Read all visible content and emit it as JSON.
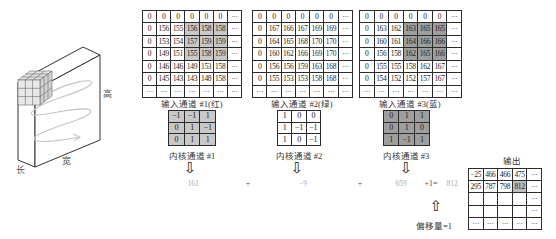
{
  "figure": {
    "axis_labels": {
      "height": "高",
      "width": "宽",
      "length": "长"
    }
  },
  "inputs": [
    {
      "label": "输入通道 #1(红)",
      "highlight_color": "#c8c8c8",
      "rows": [
        [
          "0",
          "0",
          "0",
          "0",
          "0",
          "0",
          "···"
        ],
        [
          "0",
          "156",
          "155",
          "156",
          "158",
          "158",
          "···"
        ],
        [
          "0",
          "153",
          "154",
          "157",
          "159",
          "159",
          "···"
        ],
        [
          "0",
          "149",
          "151",
          "155",
          "158",
          "159",
          "···"
        ],
        [
          "0",
          "146",
          "146",
          "149",
          "153",
          "158",
          "···"
        ],
        [
          "0",
          "145",
          "143",
          "143",
          "148",
          "158",
          "···"
        ],
        [
          "···",
          "···",
          "···",
          "···",
          "···",
          "···",
          "···"
        ]
      ]
    },
    {
      "label": "输入通道 #2(绿)",
      "highlight_color": "#ffffff",
      "rows": [
        [
          "0",
          "0",
          "0",
          "0",
          "0",
          "0",
          "···"
        ],
        [
          "0",
          "167",
          "166",
          "167",
          "169",
          "169",
          "···"
        ],
        [
          "0",
          "164",
          "165",
          "168",
          "170",
          "170",
          "···"
        ],
        [
          "0",
          "160",
          "162",
          "166",
          "169",
          "170",
          "···"
        ],
        [
          "0",
          "156",
          "156",
          "159",
          "163",
          "168",
          "···"
        ],
        [
          "0",
          "155",
          "153",
          "153",
          "158",
          "168",
          "···"
        ],
        [
          "···",
          "···",
          "···",
          "···",
          "···",
          "···",
          "···"
        ]
      ]
    },
    {
      "label": "输入通道 #3(蓝)",
      "highlight_color": "#9e9e9e",
      "rows": [
        [
          "0",
          "0",
          "0",
          "0",
          "0",
          "0",
          "···"
        ],
        [
          "0",
          "163",
          "162",
          "163",
          "165",
          "165",
          "···"
        ],
        [
          "0",
          "160",
          "161",
          "164",
          "166",
          "166",
          "···"
        ],
        [
          "0",
          "156",
          "158",
          "162",
          "165",
          "166",
          "···"
        ],
        [
          "0",
          "155",
          "155",
          "158",
          "162",
          "167",
          "···"
        ],
        [
          "0",
          "154",
          "152",
          "152",
          "157",
          "167",
          "···"
        ],
        [
          "···",
          "···",
          "···",
          "···",
          "···",
          "···",
          "···"
        ]
      ]
    }
  ],
  "kernels": [
    {
      "label": "内核通道 #1",
      "bg": "#c8c8c8",
      "rows": [
        [
          "−1",
          "−1",
          "1"
        ],
        [
          "0",
          "1",
          "−1"
        ],
        [
          "0",
          "1",
          "1"
        ]
      ]
    },
    {
      "label": "内核通道 #2",
      "bg": "#ffffff",
      "rows": [
        [
          "1",
          "0",
          "0"
        ],
        [
          "1",
          "−1",
          "−1"
        ],
        [
          "1",
          "0",
          "−1"
        ]
      ]
    },
    {
      "label": "内核通道 #3",
      "bg": "#9e9e9e",
      "rows": [
        [
          "0",
          "1",
          "1"
        ],
        [
          "0",
          "1",
          "0"
        ],
        [
          "1",
          "−1",
          "1"
        ]
      ]
    }
  ],
  "equation": {
    "term1": "161",
    "plus1": "+",
    "term2": "−9",
    "plus2": "+",
    "term3": "659",
    "bias_part": "+1=",
    "result": "812"
  },
  "bias": {
    "label": "偏移量=1"
  },
  "output": {
    "title": "输出",
    "highlight_color": "#bdbdbd",
    "rows": [
      [
        "−25",
        "466",
        "466",
        "475",
        "···"
      ],
      [
        "295",
        "787",
        "798",
        "812",
        "···"
      ],
      [
        "",
        "",
        "",
        "",
        "···"
      ],
      [
        "",
        "",
        "",
        "",
        "···"
      ],
      [
        "···",
        "···",
        "···",
        "···",
        "···"
      ]
    ]
  }
}
